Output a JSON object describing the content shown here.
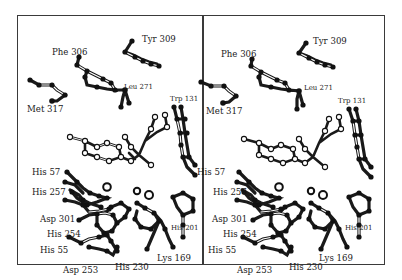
{
  "figure": {
    "type": "stereo-view",
    "colors": {
      "frame": "#3a3a3a",
      "bond_dark": "#1a1a1a",
      "atom_dark": "#111111",
      "atom_light": "#ffffff"
    }
  },
  "left_panel": {
    "labels": {
      "tyr309": "Tyr 309",
      "phe306": "Phe 306",
      "leu271": "Leu 271",
      "trp131": "Trp 131",
      "met317": "Met 317",
      "his57": "His 57",
      "his257": "His 257",
      "asp301": "Asp 301",
      "his254": "His 254",
      "his55": "His 55",
      "asp253": "Asp 253",
      "his230": "His 230",
      "lys169": "Lys 169",
      "his201": "His 201"
    }
  },
  "right_panel": {
    "labels": {
      "tyr309": "Tyr 309",
      "phe306": "Phe 306",
      "leu271": "Leu 271",
      "trp131": "Trp 131",
      "met317": "Met 317",
      "his57": "His 57",
      "his257": "His 257",
      "asp301": "Asp 301",
      "his254": "His 254",
      "his55": "His 55",
      "asp253": "Asp 253",
      "his230": "His 230",
      "lys169": "Lys 169",
      "his201": "His 201"
    }
  }
}
